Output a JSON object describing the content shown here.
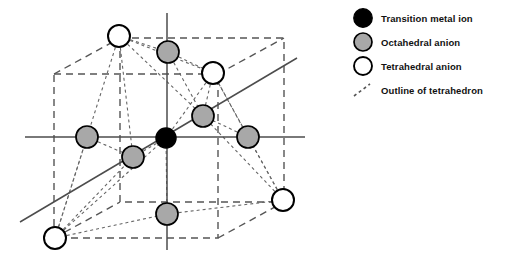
{
  "figure": {
    "kind": "crystal-structure-diagram"
  },
  "legend": {
    "items": [
      {
        "marker": "filled-black-circle",
        "fill": "#000000",
        "stroke": "#000000",
        "label": "Transition metal ion"
      },
      {
        "marker": "filled-gray-circle",
        "fill": "#a8a8a8",
        "stroke": "#000000",
        "label": "Octahedral anion"
      },
      {
        "marker": "open-white-circle",
        "fill": "#ffffff",
        "stroke": "#000000",
        "label": "Tetrahedral anion"
      },
      {
        "marker": "dashed-line-segment",
        "fill": "none",
        "stroke": "#555555",
        "label": "Outline of tetrahedron"
      }
    ]
  },
  "colors": {
    "background": "#ffffff",
    "axis_line": "#4d4d4d",
    "cell_edge": "#555555",
    "tetrahedron_edge": "#666666",
    "metal_ion": "#000000",
    "octahedral_anion": "#a8a8a8",
    "tetrahedral_anion": "#ffffff",
    "outline": "#000000",
    "text": "#111111"
  },
  "geometry": {
    "axes": [
      {
        "name": "horizontal-axis",
        "x1": 25,
        "y1": 137,
        "x2": 305,
        "y2": 137
      },
      {
        "name": "vertical-axis",
        "x1": 167,
        "y1": 13,
        "x2": 167,
        "y2": 250
      },
      {
        "name": "diagonal-axis",
        "x1": 20,
        "y1": 222,
        "x2": 297,
        "y2": 58
      }
    ],
    "cell": {
      "front_face": {
        "x": 54,
        "y": 74,
        "w": 164,
        "h": 164
      },
      "back_face": {
        "x": 120,
        "y": 38,
        "w": 164,
        "h": 164
      }
    },
    "atoms": [
      {
        "id": "metal-center",
        "type": "transition-metal-ion",
        "cx": 166,
        "cy": 138,
        "r": 10
      },
      {
        "id": "oct-left",
        "type": "octahedral-anion",
        "cx": 87,
        "cy": 137,
        "r": 11
      },
      {
        "id": "oct-right",
        "type": "octahedral-anion",
        "cx": 248,
        "cy": 137,
        "r": 11
      },
      {
        "id": "oct-top",
        "type": "octahedral-anion",
        "cx": 168,
        "cy": 52,
        "r": 11
      },
      {
        "id": "oct-bottom",
        "type": "octahedral-anion",
        "cx": 167,
        "cy": 214,
        "r": 11
      },
      {
        "id": "oct-back",
        "type": "octahedral-anion",
        "cx": 203,
        "cy": 116,
        "r": 11
      },
      {
        "id": "oct-front",
        "type": "octahedral-anion",
        "cx": 133,
        "cy": 157,
        "r": 11
      },
      {
        "id": "tet-top-left",
        "type": "tetrahedral-anion",
        "cx": 119,
        "cy": 36,
        "r": 11
      },
      {
        "id": "tet-top-right",
        "type": "tetrahedral-anion",
        "cx": 213,
        "cy": 73,
        "r": 11
      },
      {
        "id": "tet-bottom-left",
        "type": "tetrahedral-anion",
        "cx": 55,
        "cy": 238,
        "r": 11
      },
      {
        "id": "tet-bottom-right",
        "type": "tetrahedral-anion",
        "cx": 283,
        "cy": 200,
        "r": 11
      }
    ]
  }
}
